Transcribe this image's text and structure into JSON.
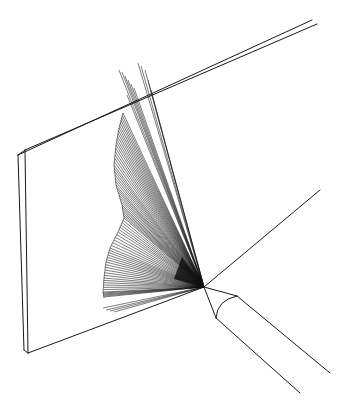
{
  "figure": {
    "title": "Line illustration: fan of rays from a probe tip striking a plate",
    "background": "#ffffff",
    "ink": "#1a1a1a"
  },
  "plate": {
    "front_top_left": [
      18,
      155
    ],
    "back_top_left": [
      25,
      150
    ],
    "front_top_right": [
      312,
      20
    ],
    "back_top_right": [
      317,
      24
    ],
    "front_bottom_left": [
      24,
      350
    ],
    "back_bottom_left": [
      28,
      353
    ],
    "bottom_edge_end": [
      204,
      287
    ],
    "bottom_extension_end": [
      320,
      190
    ]
  },
  "probe": {
    "tip": [
      204,
      287
    ],
    "cone_upper": [
      237,
      296
    ],
    "cone_lower": [
      216,
      318
    ],
    "body_upper_end": [
      330,
      373
    ],
    "body_lower_end": [
      300,
      393
    ]
  },
  "spray": {
    "origin": [
      204,
      287
    ],
    "boundary": [
      [
        123,
        113
      ],
      [
        119,
        128
      ],
      [
        116,
        145
      ],
      [
        114,
        165
      ],
      [
        116,
        185
      ],
      [
        122,
        205
      ],
      [
        124,
        218
      ],
      [
        118,
        232
      ],
      [
        110,
        248
      ],
      [
        106,
        262
      ],
      [
        104,
        278
      ],
      [
        103,
        292
      ],
      [
        104,
        298
      ]
    ],
    "overflow_rays": [
      [
        119,
        70
      ],
      [
        122,
        72
      ],
      [
        125,
        76
      ],
      [
        128,
        80
      ],
      [
        131,
        84
      ],
      [
        138,
        63
      ],
      [
        141,
        66
      ],
      [
        145,
        70
      ],
      [
        148,
        80
      ],
      [
        151,
        90
      ],
      [
        134,
        88
      ],
      [
        127,
        95
      ]
    ],
    "low_rays": [
      [
        103,
        308
      ],
      [
        106,
        310
      ],
      [
        110,
        311
      ],
      [
        114,
        312
      ]
    ]
  }
}
